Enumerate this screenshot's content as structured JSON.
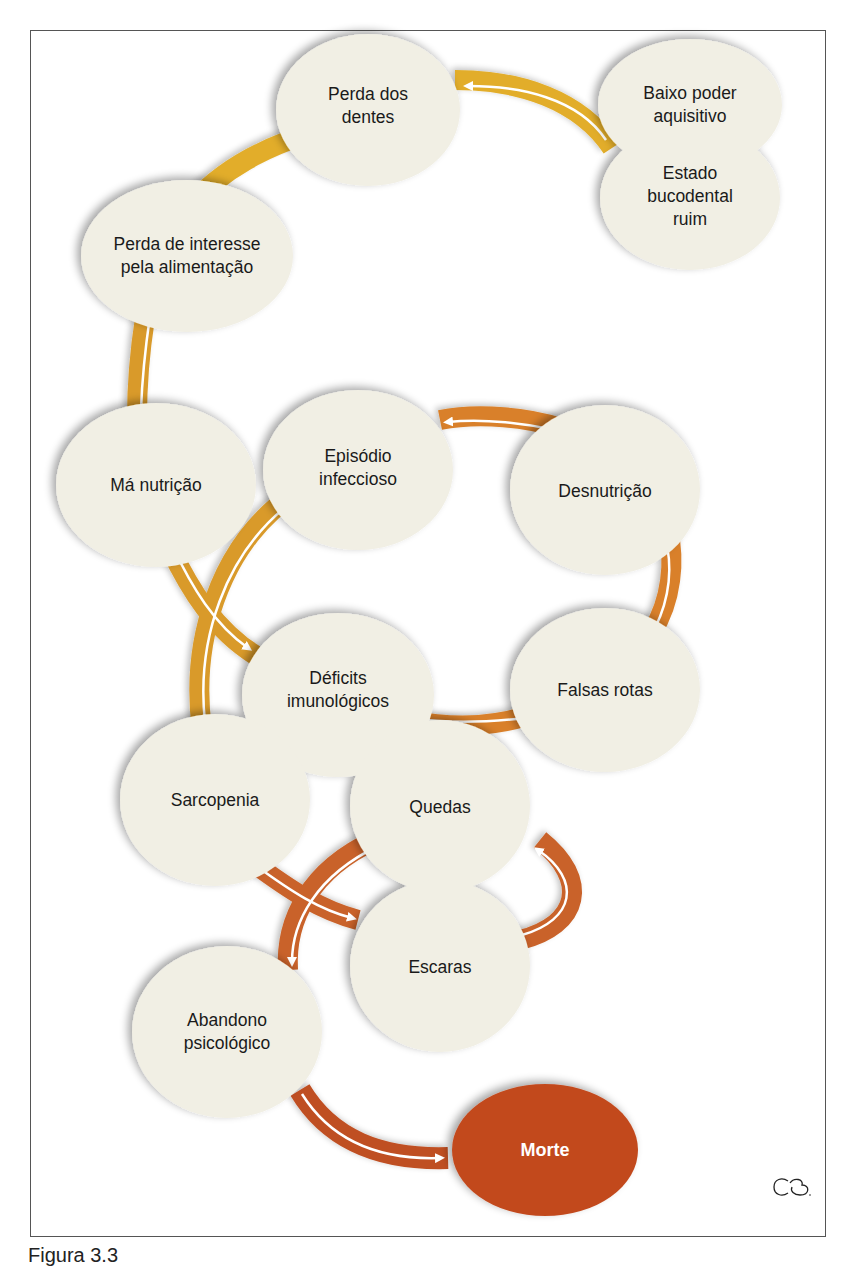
{
  "figure": {
    "caption": "Figura 3.3",
    "signature_mark": "CB"
  },
  "colors": {
    "node_fill": "#f1efe4",
    "node_shadow": "#b9b7ae",
    "band_gold": "#e2ad2a",
    "band_amber": "#d99a2b",
    "band_orange": "#d9802c",
    "band_rust": "#c96229",
    "band_dark_rust": "#bf4f22",
    "death_fill": "#c24a1f",
    "arrow_line": "#ffffff"
  },
  "nodes": [
    {
      "id": "baixo_poder",
      "label": "Baixo poder\naquisitivo",
      "cx": 690,
      "cy": 105,
      "rx": 92,
      "ry": 66
    },
    {
      "id": "estado_bucodental",
      "label": "Estado\nbucodental\nruim",
      "cx": 690,
      "cy": 198,
      "rx": 90,
      "ry": 72
    },
    {
      "id": "perda_dentes",
      "label": "Perda dos\ndentes",
      "cx": 368,
      "cy": 110,
      "rx": 92,
      "ry": 76
    },
    {
      "id": "perda_interesse",
      "label": "Perda de interesse\npela alimentação",
      "cx": 187,
      "cy": 256,
      "rx": 106,
      "ry": 76
    },
    {
      "id": "ma_nutricao",
      "label": "Má nutrição",
      "cx": 156,
      "cy": 485,
      "rx": 100,
      "ry": 82
    },
    {
      "id": "episodio_infeccioso",
      "label": "Episódio\ninfeccioso",
      "cx": 358,
      "cy": 470,
      "rx": 95,
      "ry": 80
    },
    {
      "id": "desnutricao",
      "label": "Desnutrição",
      "cx": 605,
      "cy": 490,
      "rx": 95,
      "ry": 85
    },
    {
      "id": "deficits_imunologicos",
      "label": "Déficits\nimunológicos",
      "cx": 338,
      "cy": 695,
      "rx": 96,
      "ry": 82
    },
    {
      "id": "falsas_rotas",
      "label": "Falsas rotas",
      "cx": 605,
      "cy": 690,
      "rx": 95,
      "ry": 82
    },
    {
      "id": "sarcopenia",
      "label": "Sarcopenia",
      "cx": 215,
      "cy": 800,
      "rx": 95,
      "ry": 86
    },
    {
      "id": "quedas",
      "label": "Quedas",
      "cx": 440,
      "cy": 806,
      "rx": 90,
      "ry": 86
    },
    {
      "id": "escaras",
      "label": "Escaras",
      "cx": 440,
      "cy": 966,
      "rx": 90,
      "ry": 86
    },
    {
      "id": "abandono_psicologico",
      "label": "Abandono\npsicológico",
      "cx": 227,
      "cy": 1032,
      "rx": 95,
      "ry": 86
    },
    {
      "id": "morte",
      "label": "Morte",
      "cx": 545,
      "cy": 1150,
      "rx": 93,
      "ry": 66,
      "terminal": true
    }
  ],
  "edges": [
    {
      "from": "baixo_poder",
      "to": "perda_dentes",
      "color": "band_gold"
    },
    {
      "from": "perda_dentes",
      "to": "perda_interesse",
      "color": "band_gold"
    },
    {
      "from": "perda_interesse",
      "to": "ma_nutricao",
      "color": "band_amber"
    },
    {
      "from": "ma_nutricao",
      "to": "deficits_imunologicos",
      "color": "band_amber"
    },
    {
      "from": "deficits_imunologicos",
      "to": "falsas_rotas",
      "color": "band_orange"
    },
    {
      "from": "falsas_rotas",
      "to": "desnutricao",
      "color": "band_orange"
    },
    {
      "from": "desnutricao",
      "to": "episodio_infeccioso",
      "color": "band_orange"
    },
    {
      "from": "episodio_infeccioso",
      "to": "sarcopenia",
      "color": "band_amber"
    },
    {
      "from": "sarcopenia",
      "to": "escaras",
      "color": "band_rust"
    },
    {
      "from": "escaras",
      "to": "quedas",
      "color": "band_rust"
    },
    {
      "from": "quedas",
      "to": "abandono_psicologico",
      "color": "band_rust"
    },
    {
      "from": "abandono_psicologico",
      "to": "morte",
      "color": "band_dark_rust"
    }
  ]
}
